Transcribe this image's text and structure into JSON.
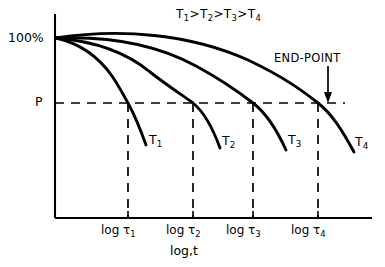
{
  "chart_data": {
    "type": "line",
    "title": "T1>T2>T3>T4",
    "title_parts": [
      {
        "base": "T",
        "sub": "1"
      },
      {
        "op": ">"
      },
      {
        "base": "T",
        "sub": "2"
      },
      {
        "op": ">"
      },
      {
        "base": "T",
        "sub": "3"
      },
      {
        "op": ">"
      },
      {
        "base": "T",
        "sub": "4"
      }
    ],
    "xlabel": "log,t",
    "ylabel": "",
    "y_axis_tick_labels": [
      "100%",
      "P"
    ],
    "y_top_label": "100%",
    "threshold_label": "P",
    "x_tick_labels": [
      "log τ₁",
      "log τ₂",
      "log τ₃",
      "log τ₄"
    ],
    "x_tick_parts": [
      {
        "base": "log τ",
        "sub": "1"
      },
      {
        "base": "log τ",
        "sub": "2"
      },
      {
        "base": "log τ",
        "sub": "3"
      },
      {
        "base": "log τ",
        "sub": "4"
      }
    ],
    "annotations": [
      {
        "text": "END-POINT",
        "target": "T4 curve crossing of P line",
        "arrow": "down"
      }
    ],
    "series": [
      {
        "name": "T1",
        "label_parts": {
          "base": "T",
          "sub": "1"
        },
        "crossing_tick": "log τ₁",
        "crossing_x": 128,
        "crossing_y": 103
      },
      {
        "name": "T2",
        "label_parts": {
          "base": "T",
          "sub": "2"
        },
        "crossing_tick": "log τ₂",
        "crossing_x": 193,
        "crossing_y": 103
      },
      {
        "name": "T3",
        "label_parts": {
          "base": "T",
          "sub": "3"
        },
        "crossing_tick": "log τ₃",
        "crossing_x": 253,
        "crossing_y": 103
      },
      {
        "name": "T4",
        "label_parts": {
          "base": "T",
          "sub": "4"
        },
        "crossing_tick": "log τ₄",
        "crossing_x": 318,
        "crossing_y": 103
      }
    ],
    "grid": false,
    "legend_position": "inline-curve-labels",
    "line_color": "#000000",
    "dash_color": "#000000",
    "axis_color": "#000000",
    "background": "#ffffff"
  }
}
